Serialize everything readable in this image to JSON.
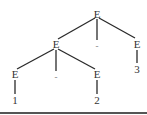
{
  "diagram": {
    "type": "parse-tree",
    "root": {
      "label": "E",
      "children": [
        {
          "label": "E",
          "children": [
            {
              "label": "E",
              "children": [
                {
                  "label": "1"
                }
              ]
            },
            {
              "label": "-"
            },
            {
              "label": "E",
              "children": [
                {
                  "label": "2"
                }
              ]
            }
          ]
        },
        {
          "label": "-"
        },
        {
          "label": "E",
          "children": [
            {
              "label": "3"
            }
          ]
        }
      ]
    },
    "labels": {
      "root": "E",
      "left": "E",
      "root_op": "-",
      "right": "E",
      "right_leaf": "3",
      "left_left": "E",
      "left_op": "-",
      "left_right": "E",
      "leaf_1": "1",
      "leaf_2": "2"
    },
    "colors": {
      "line": "#2a2a2a",
      "text": "#333333",
      "rule": "#555555"
    }
  }
}
